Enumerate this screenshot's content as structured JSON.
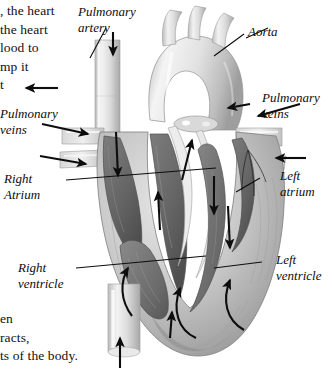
{
  "figure": {
    "style": "grayscale anatomical illustration",
    "background_color": "#ffffff",
    "line_color": "#0d0d0d",
    "width": 334,
    "height": 374
  },
  "body_text": {
    "top_lines": [
      ", the heart",
      "the heart",
      "lood to",
      "mp it",
      "t"
    ],
    "bottom_lines": [
      "en",
      "racts,",
      "ts of the body."
    ]
  },
  "labels": [
    {
      "id": "pulmonary-artery",
      "text_lines": [
        "Pulmonary",
        "artery"
      ],
      "side": "left"
    },
    {
      "id": "aorta",
      "text_lines": [
        "Aorta"
      ],
      "side": "right"
    },
    {
      "id": "pulmonary-veins-left",
      "text_lines": [
        "Pulmonary",
        "veins"
      ],
      "side": "left"
    },
    {
      "id": "pulmonary-veins-right",
      "text_lines": [
        "Pulmonary",
        "veins"
      ],
      "side": "right"
    },
    {
      "id": "right-atrium",
      "text_lines": [
        "Right",
        "Atrium"
      ],
      "side": "left"
    },
    {
      "id": "left-atrium",
      "text_lines": [
        "Left",
        "atrium"
      ],
      "side": "right"
    },
    {
      "id": "right-ventricle",
      "text_lines": [
        "Right",
        "ventricle"
      ],
      "side": "left"
    },
    {
      "id": "left-ventricle",
      "text_lines": [
        "Left",
        "ventricle"
      ],
      "side": "right"
    }
  ],
  "label_text": {
    "pulmonary_artery_1": "Pulmonary",
    "pulmonary_artery_2": "artery",
    "aorta": "Aorta",
    "pulmonary_veins_left_1": "Pulmonary",
    "pulmonary_veins_left_2": "veins",
    "pulmonary_veins_right_1": "Pulmonary",
    "pulmonary_veins_right_2": "veins",
    "right_atrium_1": "Right",
    "right_atrium_2": "Atrium",
    "left_atrium_1": "Left",
    "left_atrium_2": "atrium",
    "right_ventricle_1": "Right",
    "right_ventricle_2": "ventricle",
    "left_ventricle_1": "Left",
    "left_ventricle_2": "ventricle"
  },
  "flow_arrows": [
    {
      "id": "pulmonary-artery-outflow-down",
      "direction": "down",
      "location": "upper-left vessel"
    },
    {
      "id": "pulmonary-artery-outflow-left",
      "direction": "left",
      "location": "left mid vessel"
    },
    {
      "id": "pulmonary-veins-left-upper",
      "direction": "right",
      "location": "left veins upper"
    },
    {
      "id": "pulmonary-veins-left-lower",
      "direction": "right",
      "location": "left veins lower"
    },
    {
      "id": "pulmonary-veins-right-upper",
      "direction": "left",
      "location": "right veins upper"
    },
    {
      "id": "pulmonary-veins-right-lower",
      "direction": "left",
      "location": "right veins lower"
    },
    {
      "id": "inferior-vena-cava-inflow",
      "direction": "up",
      "location": "bottom vessel"
    },
    {
      "id": "right-atrium-internal",
      "direction": "down",
      "location": "right atrium interior"
    },
    {
      "id": "right-ventricle-loop",
      "direction": "up",
      "location": "right ventricle interior"
    },
    {
      "id": "left-ventricle-loop",
      "direction": "up",
      "location": "left ventricle interior"
    },
    {
      "id": "septum-upward",
      "direction": "up",
      "location": "central septum"
    }
  ],
  "colors": {
    "ink": "#0d0d0d",
    "vessel_light": "#e4e4e4",
    "vessel_mid": "#c6c6c6",
    "muscle_light": "#d2d2d2",
    "muscle_mid": "#9a9a9a",
    "chamber_dark": "#6e6e6e",
    "chamber_darker": "#545454",
    "outline": "#4a4a4a"
  }
}
